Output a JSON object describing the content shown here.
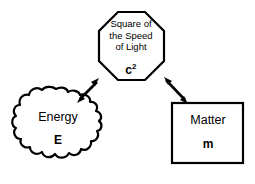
{
  "diagram": {
    "type": "concept-diagram",
    "background_color": "#ffffff",
    "stroke_color": "#000000",
    "nodes": [
      {
        "id": "speed-of-light",
        "shape": "octagon",
        "title_lines": [
          "Square of",
          "the Speed",
          "of Light"
        ],
        "title_line_1": "Square of",
        "title_line_2": "the Speed",
        "title_line_3": "of Light",
        "symbol_base": "c",
        "symbol_exponent": "2",
        "symbol": "c2"
      },
      {
        "id": "energy",
        "shape": "blob",
        "title": "Energy",
        "symbol": "E"
      },
      {
        "id": "matter",
        "shape": "rectangle",
        "title": "Matter",
        "symbol": "m"
      }
    ],
    "connectors": [
      {
        "id": "energy-to-light",
        "from": "energy",
        "to": "speed-of-light",
        "style": "double-headed-arrow"
      },
      {
        "id": "light-to-matter",
        "from": "speed-of-light",
        "to": "matter",
        "style": "double-headed-arrow"
      }
    ]
  }
}
